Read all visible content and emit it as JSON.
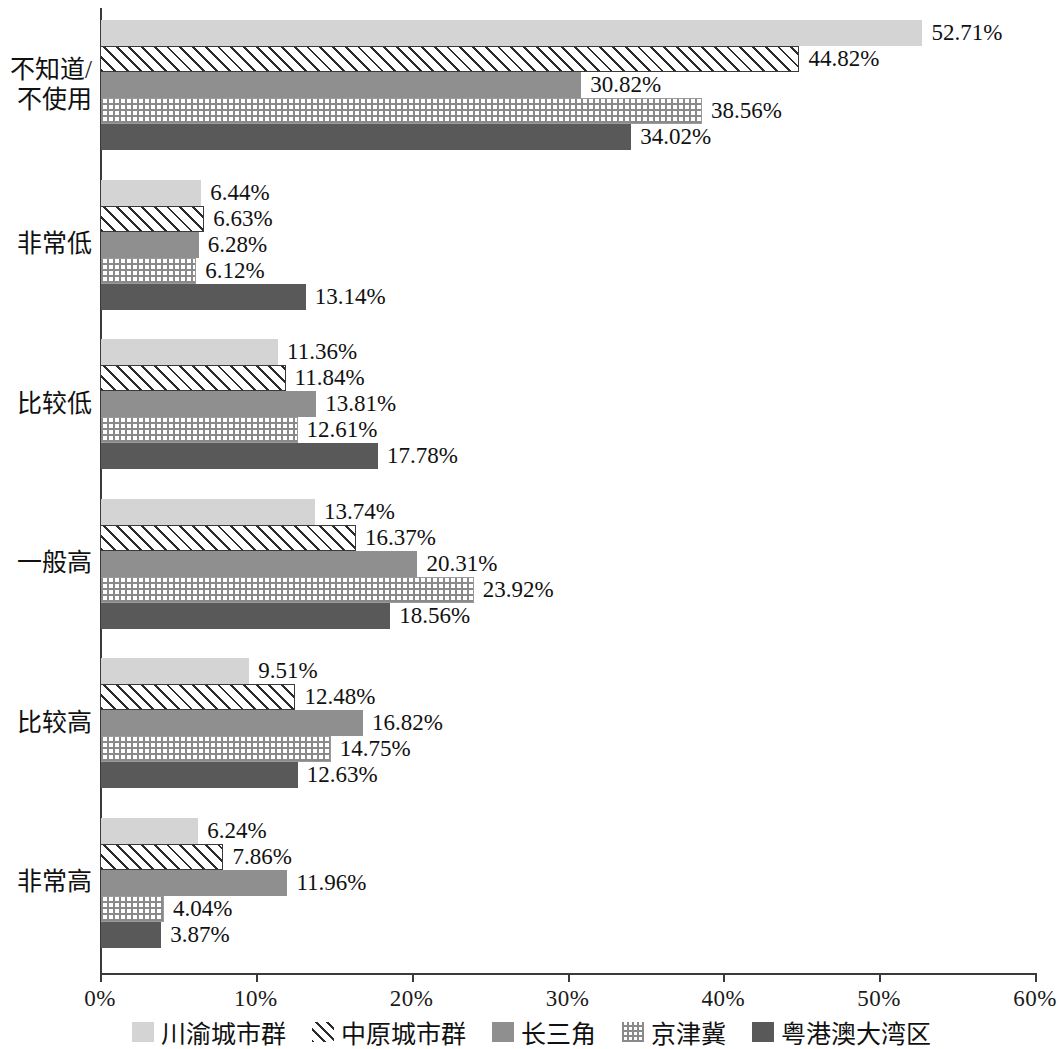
{
  "chart_data": {
    "type": "bar",
    "orientation": "horizontal",
    "title": "",
    "subtitle": "",
    "xlabel": "",
    "ylabel": "",
    "xlim": [
      0,
      60
    ],
    "xunit": "%",
    "grid": false,
    "legend_position": "bottom",
    "x_tick_labels": [
      "0%",
      "10%",
      "20%",
      "30%",
      "40%",
      "50%",
      "60%"
    ],
    "x_tick_values": [
      0,
      10,
      20,
      30,
      40,
      50,
      60
    ],
    "categories": [
      "不知道/\n不使用",
      "非常低",
      "比较低",
      "一般高",
      "比较高",
      "非常高"
    ],
    "series": [
      {
        "name": "川渝城市群",
        "pattern": "solid-light-gray",
        "color": "#d4d4d4",
        "values": [
          52.71,
          6.44,
          11.36,
          13.74,
          9.51,
          6.24
        ],
        "labels": [
          "52.71%",
          "6.44%",
          "11.36%",
          "13.74%",
          "9.51%",
          "6.24%"
        ]
      },
      {
        "name": "中原城市群",
        "pattern": "diagonal-hatch",
        "color": "#ffffff",
        "values": [
          44.82,
          6.63,
          11.84,
          16.37,
          12.48,
          7.86
        ],
        "labels": [
          "44.82%",
          "6.63%",
          "11.84%",
          "16.37%",
          "12.48%",
          "7.86%"
        ]
      },
      {
        "name": "长三角",
        "pattern": "solid-medium-gray",
        "color": "#8f8f8f",
        "values": [
          30.82,
          6.28,
          13.81,
          20.31,
          16.82,
          11.96
        ],
        "labels": [
          "30.82%",
          "6.28%",
          "13.81%",
          "20.31%",
          "16.82%",
          "11.96%"
        ]
      },
      {
        "name": "京津冀",
        "pattern": "fine-grid",
        "color": "#ffffff",
        "values": [
          38.56,
          6.12,
          12.61,
          23.92,
          14.75,
          4.04
        ],
        "labels": [
          "38.56%",
          "6.12%",
          "12.61%",
          "23.92%",
          "14.75%",
          "4.04%"
        ]
      },
      {
        "name": "粤港澳大湾区",
        "pattern": "solid-dark-gray",
        "color": "#595959",
        "values": [
          34.02,
          13.14,
          17.78,
          18.56,
          12.63,
          3.87
        ],
        "labels": [
          "34.02%",
          "13.14%",
          "17.78%",
          "18.56%",
          "12.63%",
          "3.87%"
        ]
      }
    ]
  },
  "legend": {
    "items": [
      {
        "label": "川渝城市群"
      },
      {
        "label": "中原城市群"
      },
      {
        "label": "长三角"
      },
      {
        "label": "京津冀"
      },
      {
        "label": "粤港澳大湾区"
      }
    ]
  }
}
